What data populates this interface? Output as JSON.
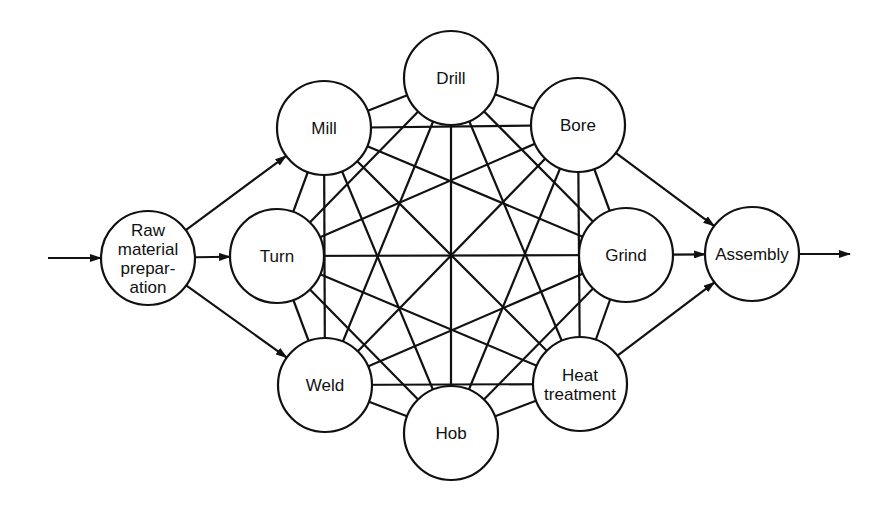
{
  "diagram": {
    "type": "process-flow-network",
    "nodes": [
      {
        "id": "raw",
        "lines": [
          "Raw",
          "material",
          "prepar-",
          "ation"
        ],
        "cx": 148,
        "cy": 258,
        "r": 47
      },
      {
        "id": "mill",
        "lines": [
          "Mill"
        ],
        "cx": 324,
        "cy": 128,
        "r": 47
      },
      {
        "id": "drill",
        "lines": [
          "Drill"
        ],
        "cx": 451,
        "cy": 78,
        "r": 47
      },
      {
        "id": "bore",
        "lines": [
          "Bore"
        ],
        "cx": 578,
        "cy": 125,
        "r": 47
      },
      {
        "id": "grind",
        "lines": [
          "Grind"
        ],
        "cx": 626,
        "cy": 255,
        "r": 47
      },
      {
        "id": "heat",
        "lines": [
          "Heat",
          "treatment"
        ],
        "cx": 580,
        "cy": 384,
        "r": 47
      },
      {
        "id": "hob",
        "lines": [
          "Hob"
        ],
        "cx": 451,
        "cy": 433,
        "r": 47
      },
      {
        "id": "weld",
        "lines": [
          "Weld"
        ],
        "cx": 325,
        "cy": 385,
        "r": 47
      },
      {
        "id": "turn",
        "lines": [
          "Turn"
        ],
        "cx": 277,
        "cy": 256,
        "r": 47
      },
      {
        "id": "assembly",
        "lines": [
          "Assembly"
        ],
        "cx": 752,
        "cy": 254,
        "r": 47
      }
    ],
    "mesh_nodes": [
      "mill",
      "drill",
      "bore",
      "grind",
      "heat",
      "hob",
      "weld",
      "turn"
    ],
    "mesh_type": "complete-graph",
    "flow_arrows": [
      {
        "from": "input",
        "to": "raw",
        "x1": 48,
        "y1": 258
      },
      {
        "from": "raw",
        "to": "mill"
      },
      {
        "from": "raw",
        "to": "turn"
      },
      {
        "from": "raw",
        "to": "weld"
      },
      {
        "from": "bore",
        "to": "assembly"
      },
      {
        "from": "grind",
        "to": "assembly"
      },
      {
        "from": "heat",
        "to": "assembly"
      },
      {
        "from": "assembly",
        "to": "output",
        "x2": 850,
        "y2": 254
      }
    ],
    "colors": {
      "stroke": "#111111",
      "background": "#ffffff"
    }
  }
}
